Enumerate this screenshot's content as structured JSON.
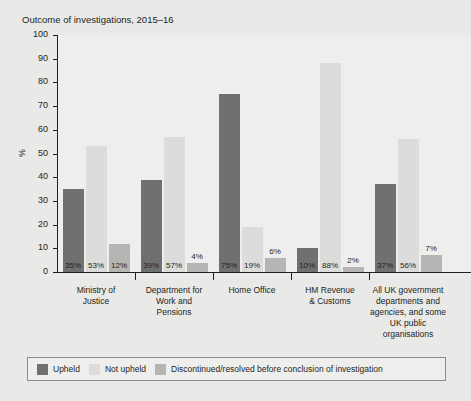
{
  "chart_data": {
    "type": "bar",
    "title": "Outcome of investigations, 2015–16",
    "xlabel": "",
    "ylabel": "%",
    "ylim": [
      0,
      100
    ],
    "ytick_step": 10,
    "yticks": [
      "100",
      "90",
      "80",
      "70",
      "60",
      "50",
      "40",
      "30",
      "20",
      "10",
      "0"
    ],
    "grid": false,
    "legend_position": "bottom",
    "categories": [
      "Ministry of Justice",
      "Department for Work and Pensions",
      "Home Office",
      "HM Revenue & Customs",
      "All UK government departments and agencies, and some UK public organisations"
    ],
    "category_lines": [
      [
        "Ministry of",
        "Justice"
      ],
      [
        "Department for",
        "Work and",
        "Pensions"
      ],
      [
        "Home Office"
      ],
      [
        "HM Revenue",
        "& Customs"
      ],
      [
        "All UK government",
        "departments and",
        "agencies, and some",
        "UK public",
        "organisations"
      ]
    ],
    "series": [
      {
        "name": "Upheld",
        "color": "#6f7071",
        "values": [
          35,
          39,
          75,
          10,
          37
        ],
        "labels": [
          "35%",
          "39%",
          "75%",
          "10%",
          "37%"
        ]
      },
      {
        "name": "Not upheld",
        "color": "#dcdcda",
        "values": [
          53,
          57,
          19,
          88,
          56
        ],
        "labels": [
          "53%",
          "57%",
          "19%",
          "88%",
          "56%"
        ]
      },
      {
        "name": "Discontinued/resolved before conclusion of investigation",
        "color": "#b5b5b3",
        "values": [
          12,
          4,
          6,
          2,
          7
        ],
        "labels": [
          "12%",
          "4%",
          "6%",
          "2%",
          "7%"
        ]
      }
    ]
  },
  "legend": {
    "items": [
      {
        "label": "Upheld",
        "color": "#6f7071"
      },
      {
        "label": "Not upheld",
        "color": "#dcdcda"
      },
      {
        "label": "Discontinued/resolved before conclusion of investigation",
        "color": "#b5b5b3"
      }
    ]
  }
}
